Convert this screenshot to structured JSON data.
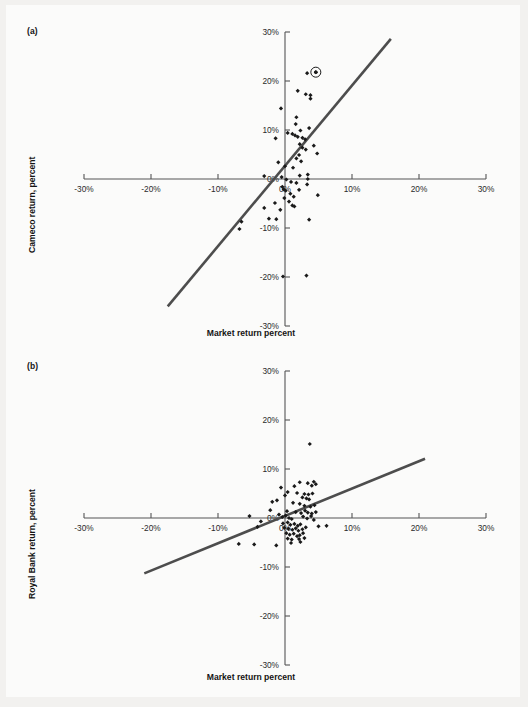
{
  "figure": {
    "background_color": "#fbfbfa",
    "page_color": "#cfcfcf",
    "axis_color": "#555555",
    "point_color": "#1a1a1a",
    "line_color": "#4d4d4d"
  },
  "panels": [
    {
      "letter": "(a)",
      "ylabel": "Cameco return, percent",
      "xlabel": "Market return percent"
    },
    {
      "letter": "(b)",
      "ylabel": "Royal Bank return, percent",
      "xlabel": "Market return percent"
    }
  ],
  "chart_data": [
    {
      "type": "scatter",
      "title": "(a)",
      "xlabel": "Market return percent",
      "ylabel": "Cameco return, percent",
      "xlim": [
        -30,
        30
      ],
      "ylim": [
        -30,
        30
      ],
      "xticks": [
        -30,
        -20,
        -10,
        0,
        10,
        20,
        30
      ],
      "yticks": [
        -30,
        -20,
        -10,
        0,
        10,
        20,
        30
      ],
      "xticklabels": [
        "-30%",
        "-20%",
        "-10%",
        "0%",
        "10%",
        "20%",
        "30%"
      ],
      "yticklabels": [
        "-30%",
        "-20%",
        "-10%",
        "0%",
        "10%",
        "20%",
        "30%"
      ],
      "grid": false,
      "legend": "none",
      "series": [
        {
          "name": "Cameco monthly returns",
          "marker": "diamond",
          "points": [
            [
              3.3,
              21.6
            ],
            [
              4.6,
              21.8
            ],
            [
              1.9,
              18.0
            ],
            [
              3.1,
              17.3
            ],
            [
              3.8,
              17.1
            ],
            [
              3.8,
              16.4
            ],
            [
              -0.6,
              14.4
            ],
            [
              1.7,
              12.6
            ],
            [
              1.6,
              11.2
            ],
            [
              3.6,
              10.4
            ],
            [
              2.3,
              9.9
            ],
            [
              0.4,
              9.4
            ],
            [
              1.1,
              9.2
            ],
            [
              1.5,
              8.9
            ],
            [
              -1.4,
              8.3
            ],
            [
              1.9,
              8.6
            ],
            [
              2.6,
              8.4
            ],
            [
              3.0,
              8.1
            ],
            [
              2.2,
              7.1
            ],
            [
              4.3,
              6.8
            ],
            [
              2.6,
              6.4
            ],
            [
              3.1,
              6.0
            ],
            [
              4.8,
              5.2
            ],
            [
              2.1,
              4.9
            ],
            [
              1.7,
              4.2
            ],
            [
              2.4,
              3.6
            ],
            [
              -1.0,
              3.4
            ],
            [
              0.0,
              2.6
            ],
            [
              1.2,
              2.3
            ],
            [
              -3.1,
              0.6
            ],
            [
              -0.5,
              0.4
            ],
            [
              2.2,
              0.7
            ],
            [
              3.4,
              0.9
            ],
            [
              3.4,
              0.0
            ],
            [
              0.2,
              -0.1
            ],
            [
              0.9,
              -0.6
            ],
            [
              1.7,
              -0.8
            ],
            [
              3.3,
              -1.1
            ],
            [
              -0.4,
              -1.6
            ],
            [
              -0.2,
              -2.1
            ],
            [
              0.1,
              -2.4
            ],
            [
              2.1,
              -2.2
            ],
            [
              0.8,
              -3.0
            ],
            [
              4.9,
              -3.3
            ],
            [
              1.3,
              -3.6
            ],
            [
              -0.1,
              -3.9
            ],
            [
              0.6,
              -4.6
            ],
            [
              -1.5,
              -4.9
            ],
            [
              1.1,
              -5.4
            ],
            [
              1.4,
              -5.6
            ],
            [
              -3.1,
              -5.9
            ],
            [
              -0.7,
              -6.3
            ],
            [
              -2.4,
              -8.1
            ],
            [
              -1.3,
              -8.2
            ],
            [
              3.6,
              -8.3
            ],
            [
              -6.5,
              -8.7
            ],
            [
              -6.8,
              -10.2
            ],
            [
              -0.3,
              -19.9
            ],
            [
              3.2,
              -19.7
            ]
          ]
        }
      ],
      "highlighted_point": {
        "x": 4.6,
        "y": 21.8,
        "style": "circled-outlier"
      },
      "fit_line": {
        "x0": -17.5,
        "y0": -26.0,
        "x1": 15.8,
        "y1": 28.6
      }
    },
    {
      "type": "scatter",
      "title": "(b)",
      "xlabel": "Market return percent",
      "ylabel": "Royal Bank return, percent",
      "xlim": [
        -30,
        30
      ],
      "ylim": [
        -30,
        30
      ],
      "xticks": [
        -30,
        -20,
        -10,
        0,
        10,
        20,
        30
      ],
      "yticks": [
        -30,
        -20,
        -10,
        0,
        10,
        20,
        30
      ],
      "xticklabels": [
        "-30%",
        "-20%",
        "-10%",
        "0%",
        "10%",
        "20%",
        "30%"
      ],
      "yticklabels": [
        "-30%",
        "-20%",
        "-10%",
        "0%",
        "10%",
        "20%",
        "30%"
      ],
      "grid": false,
      "legend": "none",
      "series": [
        {
          "name": "Royal Bank monthly returns",
          "marker": "diamond",
          "points": [
            [
              3.7,
              15.1
            ],
            [
              2.2,
              7.3
            ],
            [
              3.4,
              7.1
            ],
            [
              4.3,
              7.4
            ],
            [
              4.6,
              6.9
            ],
            [
              4.0,
              6.6
            ],
            [
              1.4,
              6.5
            ],
            [
              -0.6,
              6.2
            ],
            [
              0.4,
              5.3
            ],
            [
              1.8,
              5.1
            ],
            [
              2.9,
              4.9
            ],
            [
              3.5,
              4.8
            ],
            [
              4.1,
              5.0
            ],
            [
              0.0,
              4.6
            ],
            [
              2.6,
              4.2
            ],
            [
              3.2,
              4.0
            ],
            [
              3.6,
              3.8
            ],
            [
              -1.2,
              3.6
            ],
            [
              -1.9,
              3.3
            ],
            [
              1.2,
              3.1
            ],
            [
              2.2,
              2.9
            ],
            [
              2.9,
              2.5
            ],
            [
              3.8,
              2.3
            ],
            [
              4.4,
              2.6
            ],
            [
              -2.2,
              1.6
            ],
            [
              0.3,
              1.4
            ],
            [
              1.6,
              1.2
            ],
            [
              2.4,
              1.0
            ],
            [
              3.0,
              1.5
            ],
            [
              3.4,
              1.1
            ],
            [
              4.0,
              0.9
            ],
            [
              4.6,
              1.2
            ],
            [
              -5.3,
              0.4
            ],
            [
              -0.9,
              0.7
            ],
            [
              -0.4,
              0.2
            ],
            [
              0.1,
              0.5
            ],
            [
              0.6,
              0.0
            ],
            [
              1.0,
              -0.2
            ],
            [
              2.7,
              0.3
            ],
            [
              3.3,
              -0.1
            ],
            [
              3.9,
              0.4
            ],
            [
              4.3,
              -0.4
            ],
            [
              -3.6,
              -0.7
            ],
            [
              -0.3,
              -1.1
            ],
            [
              0.4,
              -0.9
            ],
            [
              0.8,
              -1.4
            ],
            [
              1.4,
              -1.2
            ],
            [
              1.9,
              -1.6
            ],
            [
              2.3,
              -1.3
            ],
            [
              -0.1,
              -2.0
            ],
            [
              0.5,
              -2.2
            ],
            [
              1.1,
              -2.4
            ],
            [
              1.6,
              -2.1
            ],
            [
              2.0,
              -2.6
            ],
            [
              2.6,
              -2.3
            ],
            [
              3.1,
              -1.9
            ],
            [
              -4.1,
              -1.8
            ],
            [
              5.0,
              -1.7
            ],
            [
              6.2,
              -1.6
            ],
            [
              0.2,
              -3.1
            ],
            [
              0.7,
              -3.4
            ],
            [
              1.3,
              -3.2
            ],
            [
              1.8,
              -3.7
            ],
            [
              2.2,
              -3.5
            ],
            [
              2.7,
              -3.1
            ],
            [
              0.4,
              -4.2
            ],
            [
              1.0,
              -4.4
            ],
            [
              2.1,
              -4.3
            ],
            [
              2.9,
              -4.1
            ],
            [
              0.9,
              -5.1
            ],
            [
              2.3,
              -4.9
            ],
            [
              -6.9,
              -5.3
            ],
            [
              -4.6,
              -5.4
            ],
            [
              -1.3,
              -5.6
            ]
          ]
        }
      ],
      "fit_line": {
        "x0": -21.0,
        "y0": -11.3,
        "x1": 20.9,
        "y1": 12.1
      }
    }
  ]
}
